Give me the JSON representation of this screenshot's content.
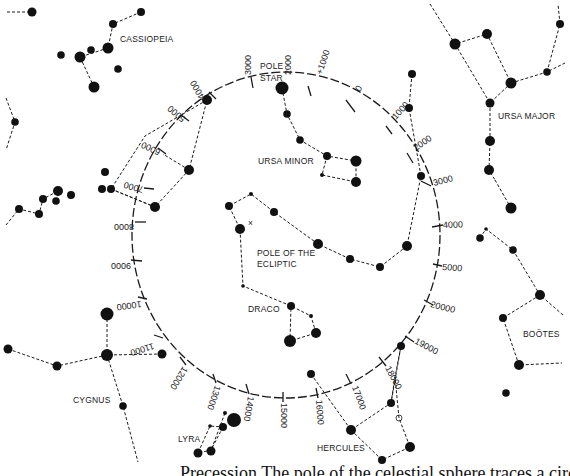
{
  "labels": {
    "cassiopeia": "CASSIOPEIA",
    "pole_star_1": "POLE",
    "pole_star_2": "STAR",
    "ursa_major": "URSA MAJOR",
    "ursa_minor": "URSA MINOR",
    "pole_ecliptic_1": "POLE OF THE",
    "pole_ecliptic_2": "ECLIPTIC",
    "draco": "DRACO",
    "bootes": "BOÖTES",
    "cygnus": "CYGNUS",
    "lyra": "LYRA",
    "hercules": "HERCULES"
  },
  "circle_ticks": [
    {
      "label": "2000",
      "x": 312,
      "y": 38,
      "rot": -90
    },
    {
      "label": "+1000",
      "x": 326,
      "y": 75,
      "rot": -75
    },
    {
      "label": "0",
      "x": 362,
      "y": 83,
      "rot": -60
    },
    {
      "label": "1000",
      "x": 395,
      "y": 118,
      "rot": -45
    },
    {
      "label": "2000",
      "x": 421,
      "y": 150,
      "rot": -35
    },
    {
      "label": "3000",
      "x": 438,
      "y": 187,
      "rot": -15
    },
    {
      "label": "4000",
      "x": 446,
      "y": 225,
      "rot": 0
    },
    {
      "label": "5000",
      "x": 443,
      "y": 268,
      "rot": 0
    },
    {
      "label": "20000",
      "x": 431,
      "y": 308,
      "rot": 12
    },
    {
      "label": "19000",
      "x": 413,
      "y": 350,
      "rot": 30
    },
    {
      "label": "18000",
      "x": 381,
      "y": 378,
      "rot": 60
    },
    {
      "label": "17000",
      "x": 353,
      "y": 390,
      "rot": 72
    },
    {
      "label": "16000",
      "x": 317,
      "y": 400,
      "rot": 85
    },
    {
      "label": "15000",
      "x": 283,
      "y": 403,
      "rot": 90
    },
    {
      "label": "14000",
      "x": 247,
      "y": 399,
      "rot": 100
    },
    {
      "label": "13000",
      "x": 211,
      "y": 380,
      "rot": 110
    },
    {
      "label": "12000",
      "x": 174,
      "y": 367,
      "rot": 125
    },
    {
      "label": "11000",
      "x": 138,
      "y": 345,
      "rot": 160
    },
    {
      "label": "10000",
      "x": 125,
      "y": 305,
      "rot": 170
    },
    {
      "label": "9000",
      "x": 115,
      "y": 267,
      "rot": 180
    },
    {
      "label": "8000",
      "x": 118,
      "y": 221,
      "rot": 180
    },
    {
      "label": "7000",
      "x": 126,
      "y": 181,
      "rot": 200
    },
    {
      "label": "6000",
      "x": 148,
      "y": 143,
      "rot": 210
    },
    {
      "label": "5000",
      "x": 175,
      "y": 108,
      "rot": 225
    },
    {
      "label": "4000",
      "x": 199,
      "y": 84,
      "rot": 240
    },
    {
      "label": "3000",
      "x": 251,
      "y": 60,
      "rot": -90
    }
  ],
  "caption_fragment": "Precession The pole of the celestial sphere traces a circle"
}
